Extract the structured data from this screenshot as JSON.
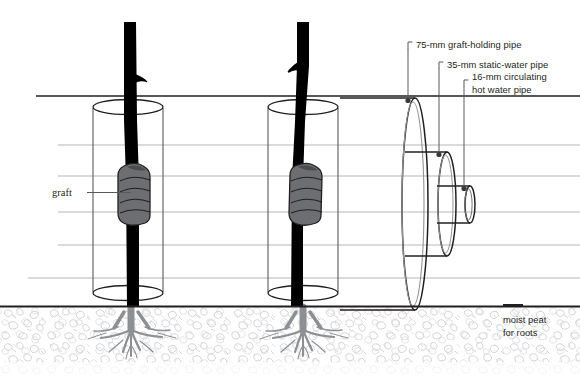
{
  "figure": {
    "background_color": "#ffffff"
  },
  "callouts": [
    {
      "id": "pipe-75",
      "label": "75-mm graft-holding pipe",
      "text_x": 414,
      "text_y": 48,
      "bracket_x": 408,
      "leader_x": 408,
      "dot_x": 408,
      "dot_y": 101
    },
    {
      "id": "pipe-35",
      "label": "35-mm static-water pipe",
      "text_x": 445,
      "text_y": 68,
      "bracket_x": 439,
      "leader_x": 439,
      "dot_x": 439,
      "dot_y": 155
    },
    {
      "id": "pipe-16",
      "label_line1": "16-mm circulating",
      "label_line2": "hot water pipe",
      "text_x": 470,
      "text_y": 86,
      "text_y2": 98,
      "bracket_x": 464,
      "leader_x": 464,
      "dot_x": 464,
      "dot_y": 190
    }
  ],
  "annotations": {
    "graft": {
      "label": "graft",
      "text_x": 52,
      "text_y": 195,
      "leader_from_x": 85,
      "leader_to_x": 130,
      "leader_y": 192
    },
    "peat": {
      "line1": "moist peat",
      "line2": "for roots",
      "text_x": 503,
      "text_y": 320,
      "text_y2": 333,
      "tick_x1": 503,
      "tick_x2": 522,
      "tick_y": 306
    }
  },
  "colors": {
    "trunk": "#000000",
    "graft_wrap_fill": "#6d6e71",
    "graft_wrap_stroke": "#231f20",
    "pipe_stroke": "#231f20",
    "tube_stroke": "#58595b",
    "waterline": "#b3b6b9",
    "ground_line": "#231f20",
    "peat_texture": "#c9ccd0",
    "root": "#8d9093",
    "text": "#231f20"
  },
  "geometry": {
    "canvas": {
      "width": 580,
      "height": 382
    },
    "ground_y": 306,
    "top_dark_line_y": 96,
    "water_lines_y": [
      145,
      176,
      212,
      245,
      278
    ],
    "trees": [
      {
        "id": "tree-left",
        "trunk_x": 131,
        "tube_cx": 128,
        "tube_rx": 35,
        "tube_top_y": 104,
        "tube_bottom_y": 296
      },
      {
        "id": "tree-right",
        "trunk_x": 303,
        "tube_cx": 303,
        "tube_rx": 35,
        "tube_top_y": 104,
        "tube_bottom_y": 296
      }
    ],
    "pipes": [
      {
        "id": "pipe-75",
        "cx": 415,
        "rx": 13,
        "ry": 106,
        "body_right_x": 415
      },
      {
        "id": "pipe-35",
        "cx": 447,
        "rx": 9,
        "ry": 53,
        "body_right_x": 447
      },
      {
        "id": "pipe-16",
        "cx": 470,
        "rx": 5,
        "ry": 25,
        "body_right_x": 470
      }
    ]
  }
}
